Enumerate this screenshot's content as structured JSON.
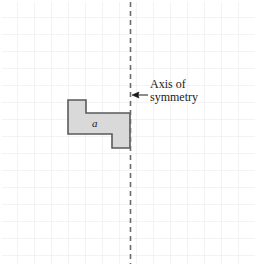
{
  "figure": {
    "width": 256,
    "height": 266,
    "background_color": "#ffffff"
  },
  "grid": {
    "cell_size": 17,
    "line_color": "#e8e8ee",
    "columns": 15,
    "rows": 16
  },
  "axis_of_symmetry": {
    "orientation": "vertical",
    "x": 130.5,
    "y_start": 2,
    "y_end": 264,
    "style": "dashed",
    "dash_pattern": "5 4",
    "color": "#6b6b6b",
    "width": 1.6
  },
  "annotation": {
    "line1": "Axis of",
    "line2": "symmetry",
    "text_color": "#1a1a1a",
    "arrow": {
      "from_x": 148,
      "from_y": 95,
      "to_x": 132,
      "to_y": 95,
      "color": "#1a1a1a",
      "direction": "left"
    }
  },
  "shape": {
    "label": "a",
    "fill_color": "#d9d9d9",
    "stroke_color": "#5a5a5a",
    "stroke_width": 1.6,
    "points": "68,100 86,100 86,113 130,113 130,148 112,148 112,134 68,134"
  }
}
